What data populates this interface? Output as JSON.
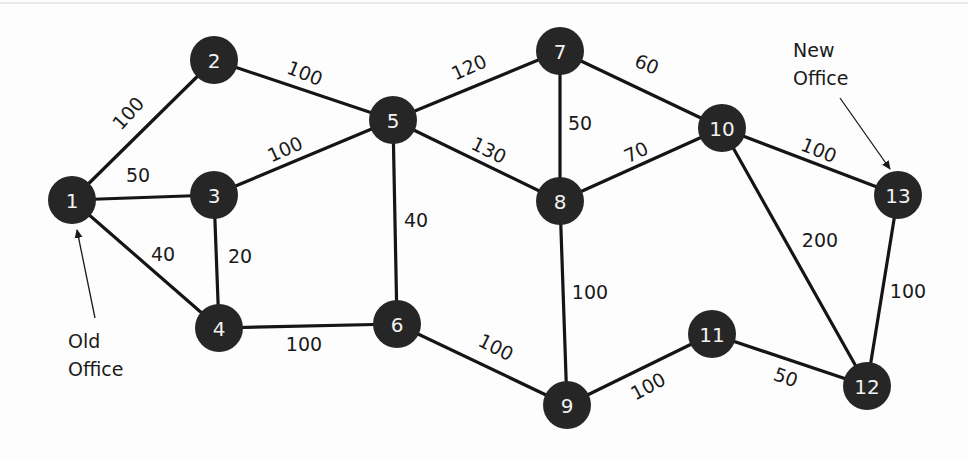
{
  "diagram": {
    "type": "weighted-undirected-graph",
    "nodes": [
      {
        "id": "1",
        "label": "1",
        "x": 72,
        "y": 200
      },
      {
        "id": "2",
        "label": "2",
        "x": 214,
        "y": 60
      },
      {
        "id": "3",
        "label": "3",
        "x": 214,
        "y": 195
      },
      {
        "id": "4",
        "label": "4",
        "x": 219,
        "y": 328
      },
      {
        "id": "5",
        "label": "5",
        "x": 393,
        "y": 120
      },
      {
        "id": "6",
        "label": "6",
        "x": 397,
        "y": 324
      },
      {
        "id": "7",
        "label": "7",
        "x": 560,
        "y": 51
      },
      {
        "id": "8",
        "label": "8",
        "x": 560,
        "y": 201
      },
      {
        "id": "9",
        "label": "9",
        "x": 567,
        "y": 405
      },
      {
        "id": "10",
        "label": "10",
        "x": 722,
        "y": 128
      },
      {
        "id": "11",
        "label": "11",
        "x": 712,
        "y": 334
      },
      {
        "id": "12",
        "label": "12",
        "x": 867,
        "y": 386
      },
      {
        "id": "13",
        "label": "13",
        "x": 898,
        "y": 195
      }
    ],
    "edges": [
      {
        "from": "1",
        "to": "2",
        "weight": "100",
        "lx": 128,
        "ly": 113,
        "rot": -48
      },
      {
        "from": "1",
        "to": "3",
        "weight": "50",
        "lx": 138,
        "ly": 175,
        "rot": 0
      },
      {
        "from": "1",
        "to": "4",
        "weight": "40",
        "lx": 163,
        "ly": 254,
        "rot": 0
      },
      {
        "from": "2",
        "to": "5",
        "weight": "100",
        "lx": 305,
        "ly": 73,
        "rot": 22
      },
      {
        "from": "3",
        "to": "5",
        "weight": "100",
        "lx": 285,
        "ly": 149,
        "rot": -24
      },
      {
        "from": "3",
        "to": "4",
        "weight": "20",
        "lx": 240,
        "ly": 256,
        "rot": 0
      },
      {
        "from": "4",
        "to": "6",
        "weight": "100",
        "lx": 304,
        "ly": 344,
        "rot": 0
      },
      {
        "from": "5",
        "to": "6",
        "weight": "40",
        "lx": 416,
        "ly": 220,
        "rot": 0
      },
      {
        "from": "5",
        "to": "7",
        "weight": "120",
        "lx": 469,
        "ly": 67,
        "rot": -24
      },
      {
        "from": "5",
        "to": "8",
        "weight": "130",
        "lx": 489,
        "ly": 150,
        "rot": 26
      },
      {
        "from": "7",
        "to": "8",
        "weight": "50",
        "lx": 580,
        "ly": 123,
        "rot": 0
      },
      {
        "from": "7",
        "to": "10",
        "weight": "60",
        "lx": 647,
        "ly": 64,
        "rot": 22
      },
      {
        "from": "8",
        "to": "10",
        "weight": "70",
        "lx": 636,
        "ly": 152,
        "rot": -26
      },
      {
        "from": "8",
        "to": "9",
        "weight": "100",
        "lx": 590,
        "ly": 292,
        "rot": 0
      },
      {
        "from": "6",
        "to": "9",
        "weight": "100",
        "lx": 496,
        "ly": 347,
        "rot": 27
      },
      {
        "from": "9",
        "to": "11",
        "weight": "100",
        "lx": 648,
        "ly": 386,
        "rot": -28
      },
      {
        "from": "10",
        "to": "13",
        "weight": "100",
        "lx": 819,
        "ly": 150,
        "rot": 22
      },
      {
        "from": "10",
        "to": "12",
        "weight": "200",
        "lx": 820,
        "ly": 240,
        "rot": 0
      },
      {
        "from": "11",
        "to": "12",
        "weight": "50",
        "lx": 786,
        "ly": 377,
        "rot": 20
      },
      {
        "from": "13",
        "to": "12",
        "weight": "100",
        "lx": 908,
        "ly": 291,
        "rot": 0
      }
    ],
    "annotations": {
      "old_office": {
        "line1": "Old",
        "line2": "Office",
        "points_to": "1"
      },
      "new_office": {
        "line1": "New",
        "line2": "Office",
        "points_to": "13"
      }
    },
    "colors": {
      "node_fill": "#262626",
      "node_text": "#f2f2f2",
      "edge": "#151515",
      "text": "#1a1a1a",
      "background": "#fdfdfd"
    }
  }
}
